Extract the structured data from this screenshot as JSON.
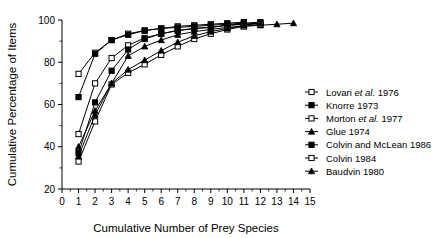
{
  "chart_data": {
    "type": "line",
    "title": "",
    "xlabel": "Cumulative Number of Prey Species",
    "ylabel": "Cumulative Percentage of Items",
    "xlim": [
      0,
      15
    ],
    "ylim": [
      20,
      100
    ],
    "xticks": [
      0,
      1,
      2,
      3,
      4,
      5,
      6,
      7,
      8,
      9,
      10,
      11,
      12,
      13,
      14,
      15
    ],
    "yticks": [
      20,
      40,
      60,
      80,
      100
    ],
    "xtick_labels": [
      "0",
      "1",
      "2",
      "3",
      "4",
      "5",
      "6",
      "7",
      "8",
      "9",
      "10",
      "11",
      "12",
      "13",
      "14",
      "15"
    ],
    "ytick_labels": [
      "20",
      "40",
      "60",
      "80",
      "100"
    ],
    "minor_ticks": true,
    "grid": false,
    "legend_position": "right-middle",
    "series": [
      {
        "name": "Lovari et al. 1976",
        "label_main": "Lovari",
        "label_italic": "et al.",
        "label_year": "1976",
        "marker": "open-square",
        "x": [
          1,
          2,
          3,
          4,
          5,
          6,
          7,
          8,
          9,
          10,
          11
        ],
        "values": [
          74.5,
          84.5,
          90.5,
          93.5,
          95.0,
          96.0,
          97.0,
          97.5,
          98.0,
          98.5,
          99.0
        ]
      },
      {
        "name": "Knorre 1973",
        "label_main": "Knorre",
        "label_italic": "",
        "label_year": "1973",
        "marker": "filled-square",
        "x": [
          1,
          2,
          3,
          4,
          5,
          6,
          7,
          8,
          9,
          10,
          11,
          12
        ],
        "values": [
          63.5,
          84.0,
          90.5,
          93.0,
          95.0,
          96.0,
          96.5,
          97.0,
          97.5,
          98.0,
          98.5,
          99.0
        ]
      },
      {
        "name": "Morton et al. 1977",
        "label_main": "Morton",
        "label_italic": "et al.",
        "label_year": "1977",
        "marker": "open-square",
        "x": [
          1,
          2,
          3,
          4,
          5,
          6,
          7,
          8,
          9,
          10,
          11,
          12
        ],
        "values": [
          46.0,
          70.0,
          82.0,
          88.0,
          91.5,
          93.5,
          95.0,
          96.0,
          96.5,
          97.5,
          98.0,
          98.5
        ]
      },
      {
        "name": "Glue 1974",
        "label_main": "Glue",
        "label_italic": "",
        "label_year": "1974",
        "marker": "filled-triangle",
        "x": [
          1,
          2,
          3,
          4,
          5,
          6,
          7,
          8,
          9,
          10,
          11,
          12,
          13,
          14
        ],
        "values": [
          40.0,
          57.0,
          70.0,
          83.0,
          87.5,
          90.5,
          93.0,
          94.5,
          95.5,
          96.5,
          97.0,
          97.5,
          98.0,
          98.5
        ]
      },
      {
        "name": "Colvin and McLean 1986",
        "label_main": "Colvin and McLean",
        "label_italic": "",
        "label_year": "1986",
        "marker": "filled-square",
        "x": [
          1,
          2,
          3,
          4,
          5,
          6,
          7,
          8,
          9,
          10,
          11,
          12
        ],
        "values": [
          37.0,
          61.0,
          76.0,
          86.0,
          91.0,
          93.5,
          95.0,
          96.0,
          96.5,
          97.5,
          98.0,
          98.5
        ]
      },
      {
        "name": "Colvin 1984",
        "label_main": "Colvin",
        "label_italic": "",
        "label_year": "1984",
        "marker": "open-square",
        "x": [
          1,
          2,
          3,
          4,
          5,
          6,
          7,
          8,
          9,
          10,
          11,
          12
        ],
        "values": [
          33.0,
          52.0,
          69.5,
          75.0,
          79.0,
          83.5,
          87.5,
          91.0,
          93.5,
          95.5,
          97.0,
          98.0
        ]
      },
      {
        "name": "Baudvin 1980",
        "label_main": "Baudvin",
        "label_italic": "",
        "label_year": "1980",
        "marker": "filled-triangle",
        "x": [
          1,
          2,
          3,
          4,
          5,
          6,
          7,
          8,
          9,
          10,
          11,
          12
        ],
        "values": [
          35.5,
          55.0,
          70.0,
          76.5,
          81.0,
          85.5,
          89.5,
          92.5,
          94.5,
          96.0,
          97.5,
          98.5
        ]
      }
    ]
  }
}
